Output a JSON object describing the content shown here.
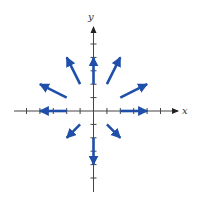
{
  "figure": {
    "type": "vector-field",
    "axes": {
      "x_label": "x",
      "y_label": "y",
      "origin_px": [
        93.5,
        111
      ],
      "unit_px": 13.4,
      "x_ticks": [
        -5,
        -4,
        -3,
        -2,
        -1,
        1,
        2,
        3,
        4,
        5
      ],
      "y_ticks": [
        -5,
        -4,
        -3,
        -2,
        -1,
        1,
        2,
        3,
        4,
        5
      ],
      "axis_color": "#333333"
    },
    "vector_color": "#1f4fa8",
    "vectors": [
      {
        "from": [
          2,
          0
        ],
        "to": [
          4,
          0
        ]
      },
      {
        "from": [
          -2,
          0
        ],
        "to": [
          -4,
          0
        ]
      },
      {
        "from": [
          0,
          2
        ],
        "to": [
          0,
          4
        ]
      },
      {
        "from": [
          0,
          -2
        ],
        "to": [
          0,
          -4
        ]
      },
      {
        "from": [
          1,
          2
        ],
        "to": [
          2,
          4
        ]
      },
      {
        "from": [
          -1,
          2
        ],
        "to": [
          -2,
          4
        ]
      },
      {
        "from": [
          2,
          1
        ],
        "to": [
          4,
          2
        ]
      },
      {
        "from": [
          -2,
          1
        ],
        "to": [
          -4,
          2
        ]
      },
      {
        "from": [
          1,
          -1
        ],
        "to": [
          2,
          -2
        ]
      },
      {
        "from": [
          -1,
          -1
        ],
        "to": [
          -2,
          -2
        ]
      }
    ]
  }
}
